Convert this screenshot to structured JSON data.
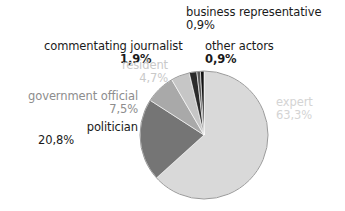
{
  "chart_data": {
    "type": "pie",
    "title": "",
    "subtitle": "",
    "xlabel": "",
    "ylabel": "",
    "legend_position": "none",
    "grid": false,
    "value_suffix": "%",
    "decimal_separator": ",",
    "total": 100.0,
    "start_angle_deg": 0,
    "direction": "clockwise",
    "categories": [
      "expert",
      "politician",
      "government official",
      "resident",
      "commentating journalist",
      "business representative",
      "other actors"
    ],
    "values": [
      63.3,
      20.8,
      7.5,
      4.7,
      1.9,
      0.9,
      0.9
    ],
    "slices": [
      {
        "label": "expert",
        "value": 63.3,
        "value_text": "63,3%",
        "color": "#d9d9d9",
        "label_color": "#d4d4d4"
      },
      {
        "label": "politician",
        "value": 20.8,
        "value_text": "20,8%",
        "color": "#757575",
        "label_color": "#1a1a1a"
      },
      {
        "label": "government official",
        "value": 7.5,
        "value_text": "7,5%",
        "color": "#a9a9a9",
        "label_color": "#8d8d8d"
      },
      {
        "label": "resident",
        "value": 4.7,
        "value_text": "4,7%",
        "color": "#c6c6c6",
        "label_color": "#c9c9c9"
      },
      {
        "label": "commentating journalist",
        "value": 1.9,
        "value_text": "1,9%",
        "color": "#2b2b2b",
        "label_color": "#1a1a1a"
      },
      {
        "label": "business representative",
        "value": 0.9,
        "value_text": "0,9%",
        "color": "#5a5a5a",
        "label_color": "#1a1a1a"
      },
      {
        "label": "other actors",
        "value": 0.9,
        "value_text": "0,9%",
        "color": "#111111",
        "label_color": "#1a1a1a"
      }
    ]
  },
  "labels": {
    "business_representative": {
      "name": "business representative",
      "pct": "0,9%"
    },
    "commentating_journalist": {
      "name": "commentating journalist",
      "pct": "1,9%"
    },
    "other_actors": {
      "name": "other actors",
      "pct": "0,9%"
    },
    "resident": {
      "name": "resident",
      "pct": "4,7%"
    },
    "government_official": {
      "name": "government official",
      "pct": "7,5%"
    },
    "politician": {
      "name": "politician",
      "pct": "20,8%"
    },
    "expert": {
      "name": "expert",
      "pct": "63,3%"
    }
  },
  "geometry": {
    "center_x": 204,
    "center_y": 135,
    "radius": 64,
    "outline_color": "#9a9a9a"
  },
  "colors": {
    "background": "#ffffff",
    "text_dark": "#1a1a1a",
    "text_mid": "#8d8d8d",
    "text_light": "#c9c9c9",
    "text_faint": "#d4d4d4"
  }
}
